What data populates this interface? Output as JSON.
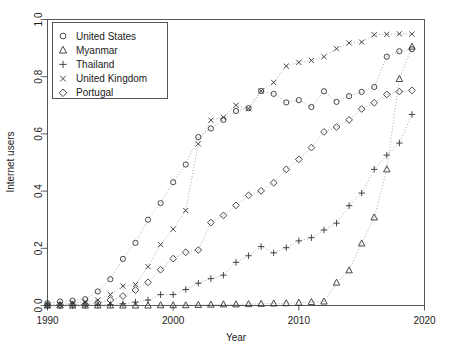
{
  "chart_data": {
    "type": "scatter",
    "title": "",
    "xlabel": "Year",
    "ylabel": "Internet users",
    "xlim": [
      1990,
      2020
    ],
    "ylim": [
      0.0,
      1.0
    ],
    "xticks": [
      1990,
      2000,
      2010,
      2020
    ],
    "xtick_labels": [
      "1990",
      "2000",
      "2010",
      "2020"
    ],
    "yticks": [
      0.0,
      0.2,
      0.4,
      0.6,
      0.8,
      1.0
    ],
    "ytick_labels": [
      "0.0",
      "0.2",
      "0.4",
      "0.6",
      "0.8",
      "1.0"
    ],
    "grid": false,
    "legend_position": "top-left",
    "x": [
      1990,
      1991,
      1992,
      1993,
      1994,
      1995,
      1996,
      1997,
      1998,
      1999,
      2000,
      2001,
      2002,
      2003,
      2004,
      2005,
      2006,
      2007,
      2008,
      2009,
      2010,
      2011,
      2012,
      2013,
      2014,
      2015,
      2016,
      2017,
      2018,
      2019
    ],
    "series": [
      {
        "name": "United States",
        "symbol": "circle",
        "values": [
          0.008,
          0.014,
          0.017,
          0.022,
          0.049,
          0.092,
          0.163,
          0.219,
          0.3,
          0.358,
          0.431,
          0.493,
          0.589,
          0.619,
          0.649,
          0.68,
          0.69,
          0.75,
          0.74,
          0.71,
          0.718,
          0.694,
          0.749,
          0.712,
          0.732,
          0.747,
          0.764,
          0.87,
          0.889,
          0.896
        ]
      },
      {
        "name": "Myanmar",
        "symbol": "triangle",
        "values": [
          0.0,
          0.0,
          0.0,
          0.0,
          0.0,
          0.0,
          0.0,
          0.0,
          0.0,
          0.001,
          0.001,
          0.001,
          0.002,
          0.003,
          0.004,
          0.004,
          0.005,
          0.006,
          0.007,
          0.008,
          0.01,
          0.012,
          0.014,
          0.08,
          0.123,
          0.217,
          0.308,
          0.476,
          0.792,
          0.905
        ]
      },
      {
        "name": "Thailand",
        "symbol": "plus",
        "values": [
          0.0,
          0.0,
          0.0,
          0.001,
          0.002,
          0.003,
          0.006,
          0.012,
          0.019,
          0.038,
          0.038,
          0.056,
          0.078,
          0.094,
          0.106,
          0.151,
          0.174,
          0.206,
          0.184,
          0.202,
          0.226,
          0.237,
          0.264,
          0.288,
          0.349,
          0.393,
          0.476,
          0.526,
          0.568,
          0.668
        ]
      },
      {
        "name": "United Kingdom",
        "symbol": "cross",
        "values": [
          0.001,
          0.003,
          0.009,
          0.013,
          0.019,
          0.038,
          0.068,
          0.073,
          0.136,
          0.213,
          0.267,
          0.332,
          0.565,
          0.648,
          0.658,
          0.7,
          0.688,
          0.75,
          0.78,
          0.837,
          0.85,
          0.857,
          0.87,
          0.898,
          0.918,
          0.921,
          0.947,
          0.948,
          0.95,
          0.949
        ]
      },
      {
        "name": "Portugal",
        "symbol": "diamond",
        "values": [
          0.001,
          0.002,
          0.003,
          0.004,
          0.009,
          0.019,
          0.033,
          0.054,
          0.081,
          0.125,
          0.164,
          0.186,
          0.194,
          0.29,
          0.315,
          0.35,
          0.385,
          0.401,
          0.429,
          0.476,
          0.511,
          0.552,
          0.607,
          0.624,
          0.649,
          0.687,
          0.709,
          0.738,
          0.748,
          0.752
        ]
      }
    ]
  },
  "legend": {
    "items": [
      {
        "label": "United States",
        "symbol": "circle"
      },
      {
        "label": "Myanmar",
        "symbol": "triangle"
      },
      {
        "label": "Thailand",
        "symbol": "plus"
      },
      {
        "label": "United Kingdom",
        "symbol": "cross"
      },
      {
        "label": "Portugal",
        "symbol": "diamond"
      }
    ]
  },
  "colors": {
    "point": "#333333",
    "line": "#888888",
    "frame": "#555555",
    "text": "#1a1a1a",
    "background": "#ffffff"
  }
}
